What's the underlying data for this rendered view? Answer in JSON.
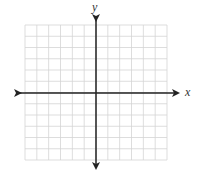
{
  "chart_data": {
    "type": "coordinate-grid",
    "title": "",
    "xlabel": "x",
    "ylabel": "y",
    "xlim": [
      -6,
      6
    ],
    "ylim": [
      -6,
      6
    ],
    "grid": true,
    "grid_cells_x": 12,
    "grid_cells_y": 12,
    "tick_labels": [],
    "series": []
  },
  "labels": {
    "x_axis": "x",
    "y_axis": "y"
  },
  "colors": {
    "grid": "#d4d4d4",
    "axis": "#222222",
    "background": "#ffffff"
  }
}
